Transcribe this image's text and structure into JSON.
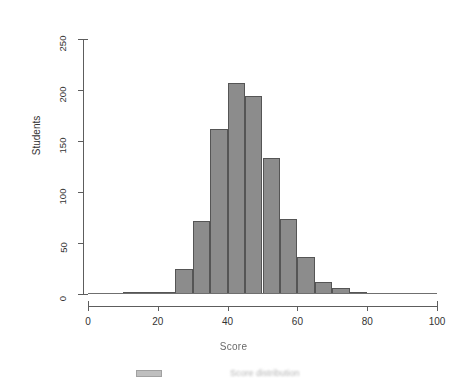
{
  "figure": {
    "background_color": "#ffffff",
    "bar_fill_color": "#8c8c8c",
    "bar_border_color": "#555555",
    "axis_color": "#5d5d5d"
  },
  "axes": {
    "y": {
      "title": "Students",
      "ticks": [
        0,
        50,
        100,
        150,
        200,
        250
      ],
      "tick_labels": [
        "0",
        "50",
        "100",
        "150",
        "200",
        "250"
      ],
      "min": 0,
      "max": 250
    },
    "x": {
      "title": "Score",
      "ticks": [
        0,
        20,
        40,
        60,
        80,
        100
      ],
      "tick_labels": [
        "0",
        "20",
        "40",
        "60",
        "80",
        "100"
      ],
      "min": 0,
      "max": 100
    }
  },
  "legend": {
    "swatch_color": "#8c8c8c",
    "label": "Score distribution"
  },
  "chart_data": {
    "type": "bar",
    "title": "",
    "xlabel": "Score",
    "ylabel": "Students",
    "xlim": [
      0,
      100
    ],
    "ylim": [
      0,
      250
    ],
    "grid": false,
    "legend_position": "bottom",
    "bin_width": 5,
    "bin_edges": [
      10,
      15,
      20,
      25,
      30,
      35,
      40,
      45,
      50,
      55,
      60,
      65,
      70,
      75,
      80
    ],
    "categories": [
      "10-15",
      "15-20",
      "20-25",
      "25-30",
      "30-35",
      "35-40",
      "40-45",
      "45-50",
      "50-55",
      "55-60",
      "60-65",
      "65-70",
      "70-75",
      "75-80"
    ],
    "values": [
      1,
      2,
      2,
      25,
      72,
      162,
      207,
      194,
      133,
      74,
      36,
      12,
      6,
      1
    ],
    "series": [
      {
        "name": "Students",
        "values": [
          1,
          2,
          2,
          25,
          72,
          162,
          207,
          194,
          133,
          74,
          36,
          12,
          6,
          1
        ]
      }
    ]
  }
}
